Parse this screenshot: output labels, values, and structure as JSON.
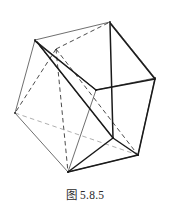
{
  "figure": {
    "caption_label": "图",
    "caption_number": "5.8.5",
    "caption_full": "图 5.8.5",
    "colors": {
      "background": "#ffffff",
      "solid_edge": "#1a1a1a",
      "thin_edge": "#4a4a4a",
      "hidden_edge_dark": "#2a2a2a",
      "hidden_edge_light": "#9a9a9a",
      "caption_text": "#2b2b2b"
    },
    "stroke_widths": {
      "inscribed": 1.5,
      "cube_visible": 0.8,
      "cube_hidden": 0.85
    },
    "vertices": {
      "cube": {
        "front_top_left": [
          35,
          40
        ],
        "front_top_right": [
          110,
          22
        ],
        "front_bottom_left": [
          15,
          113
        ],
        "front_bottom_right": [
          96,
          90
        ],
        "back_top_left": [
          56,
          49
        ],
        "back_top_right": [
          155,
          78
        ],
        "back_bottom_left": [
          68,
          172
        ],
        "back_bottom_right": [
          138,
          155
        ]
      },
      "hexagon": [
        [
          35,
          40
        ],
        [
          110,
          22
        ],
        [
          155,
          78
        ],
        [
          138,
          155
        ],
        [
          68,
          172
        ],
        [
          15,
          113
        ]
      ],
      "inner_hub": [
        113,
        138
      ]
    },
    "edges": {
      "hexagon_outline_count": 6,
      "inscribed_chord_count": 6,
      "hidden_dashed_count": 7
    }
  }
}
